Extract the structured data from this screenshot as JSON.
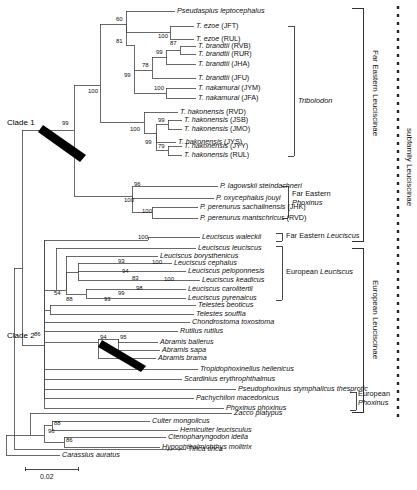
{
  "figure": {
    "type": "phylogenetic-tree",
    "scale_bar": {
      "label": "0.02",
      "value": 0.02
    },
    "clade_annotations": [
      {
        "label": "Clade 1",
        "support": "99"
      },
      {
        "label": "Clade 2",
        "support": "86"
      }
    ],
    "right_vertical_labels": [
      {
        "text": "Far Eastern Leuciscinae"
      },
      {
        "text": "subfamily Leuciscinae"
      },
      {
        "text": "European Leuciscinae"
      }
    ],
    "group_labels": [
      {
        "text": "Tribolodon",
        "italic": true
      },
      {
        "text": "Far Eastern",
        "italic": false
      },
      {
        "text": "Phoxinus",
        "italic": true
      },
      {
        "text": "Far Eastern ",
        "italic": false
      },
      {
        "text": "Leuciscus",
        "italic": true
      },
      {
        "text": "European Leuciscus",
        "italic": false
      },
      {
        "text": "European",
        "italic": false
      },
      {
        "text": "Phoxinus",
        "italic": true
      }
    ],
    "taxa": [
      {
        "id": "t1",
        "name": "Pseudaspius leptocephalus",
        "pop": ""
      },
      {
        "id": "t2",
        "name": "T. ezoe",
        "pop": "(JFT)"
      },
      {
        "id": "t3",
        "name": "T. ezoe",
        "pop": "(RUL)"
      },
      {
        "id": "t4",
        "name": "T. brandtii",
        "pop": "(RVB)"
      },
      {
        "id": "t5",
        "name": "T. brandtii",
        "pop": "(RUR)"
      },
      {
        "id": "t6",
        "name": "T. brandtii",
        "pop": "(JHA)"
      },
      {
        "id": "t7",
        "name": "T. brandtii",
        "pop": "(JFU)"
      },
      {
        "id": "t8",
        "name": "T. nakamurai",
        "pop": "(JYM)"
      },
      {
        "id": "t9",
        "name": "T. nakamurai",
        "pop": "(JFA)"
      },
      {
        "id": "t10",
        "name": "T. hakonensis",
        "pop": "(RVD)"
      },
      {
        "id": "t11",
        "name": "T. hakonensis",
        "pop": "(JSB)"
      },
      {
        "id": "t12",
        "name": "T. hakonensis",
        "pop": "(JMO)"
      },
      {
        "id": "t13",
        "name": "T. hakonensis",
        "pop": "(JYS)"
      },
      {
        "id": "t14",
        "name": "T. hakonensis",
        "pop": "(JYY)"
      },
      {
        "id": "t15",
        "name": "T. hakonensis",
        "pop": "(RUL)"
      },
      {
        "id": "t16",
        "name": "P. lagowskii steindachneri",
        "pop": ""
      },
      {
        "id": "t17",
        "name": "P. oxycephalus jouyi",
        "pop": ""
      },
      {
        "id": "t18",
        "name": "P. perenurus sachalinensis",
        "pop": "(JHK)"
      },
      {
        "id": "t19",
        "name": "P. perenurus mantschricus",
        "pop": "(RVD)"
      },
      {
        "id": "t20",
        "name": "Leuciscus waleckii",
        "pop": ""
      },
      {
        "id": "t21",
        "name": "Leuciscus leuciscus",
        "pop": ""
      },
      {
        "id": "t22",
        "name": "Leuciscus borysthenicus",
        "pop": ""
      },
      {
        "id": "t23",
        "name": "Leuciscus cephalus",
        "pop": ""
      },
      {
        "id": "t24",
        "name": "Leuciscus peloponnesis",
        "pop": ""
      },
      {
        "id": "t25",
        "name": "Leuciscus keadicus",
        "pop": ""
      },
      {
        "id": "t26",
        "name": "Leuciscus carolitertii",
        "pop": ""
      },
      {
        "id": "t27",
        "name": "Leuciscus pyrenaicus",
        "pop": ""
      },
      {
        "id": "t28",
        "name": "Telestes beoticus",
        "pop": ""
      },
      {
        "id": "t29",
        "name": "Telestes souffia",
        "pop": ""
      },
      {
        "id": "t30",
        "name": "Chondrostoma toxostoma",
        "pop": ""
      },
      {
        "id": "t31",
        "name": "Rutilus rutilus",
        "pop": ""
      },
      {
        "id": "t32",
        "name": "Abramis ballerus",
        "pop": ""
      },
      {
        "id": "t33",
        "name": "Abramis sapa",
        "pop": ""
      },
      {
        "id": "t34",
        "name": "Abramis brama",
        "pop": ""
      },
      {
        "id": "t35",
        "name": "Tropidophoxinellus hellenicus",
        "pop": ""
      },
      {
        "id": "t36",
        "name": "Scardinius erythrophthalmus",
        "pop": ""
      },
      {
        "id": "t37",
        "name": "Pseudophoxinus stymphalicus thesprotic",
        "pop": ""
      },
      {
        "id": "t38",
        "name": "Pachychilon macedonicus",
        "pop": ""
      },
      {
        "id": "t39",
        "name": "Phoxinus phoxinus",
        "pop": ""
      },
      {
        "id": "t40",
        "name": "Zacco platypus",
        "pop": ""
      },
      {
        "id": "t41",
        "name": "Culter mongolicus",
        "pop": ""
      },
      {
        "id": "t42",
        "name": "Hemiculter leucisculus",
        "pop": ""
      },
      {
        "id": "t43",
        "name": "Ctenopharyngodon idella",
        "pop": ""
      },
      {
        "id": "t44",
        "name": "Hypophthalmichthys molitrix",
        "pop": ""
      },
      {
        "id": "t45",
        "name": "Tinca tinca",
        "pop": ""
      },
      {
        "id": "t46",
        "name": "Carassius auratus",
        "pop": ""
      }
    ],
    "bootstrap_values": [
      {
        "id": "b1",
        "value": "60"
      },
      {
        "id": "b2",
        "value": "100"
      },
      {
        "id": "b3",
        "value": "81"
      },
      {
        "id": "b4",
        "value": "87"
      },
      {
        "id": "b5",
        "value": "99"
      },
      {
        "id": "b6",
        "value": "78"
      },
      {
        "id": "b7",
        "value": "99"
      },
      {
        "id": "b8",
        "value": "100"
      },
      {
        "id": "b9",
        "value": "100"
      },
      {
        "id": "b10",
        "value": "99"
      },
      {
        "id": "b11",
        "value": "100"
      },
      {
        "id": "b12",
        "value": "99"
      },
      {
        "id": "b13",
        "value": "99"
      },
      {
        "id": "b14",
        "value": "79"
      },
      {
        "id": "b15",
        "value": "96"
      },
      {
        "id": "b16",
        "value": "100"
      },
      {
        "id": "b17",
        "value": "100"
      },
      {
        "id": "b18",
        "value": "100"
      },
      {
        "id": "b19",
        "value": "93"
      },
      {
        "id": "b20",
        "value": "100"
      },
      {
        "id": "b21",
        "value": "94"
      },
      {
        "id": "b22",
        "value": "83"
      },
      {
        "id": "b23",
        "value": "100"
      },
      {
        "id": "b24",
        "value": "98"
      },
      {
        "id": "b25",
        "value": "99"
      },
      {
        "id": "b26",
        "value": "93"
      },
      {
        "id": "b27",
        "value": "54"
      },
      {
        "id": "b28",
        "value": "88"
      },
      {
        "id": "b29",
        "value": "94"
      },
      {
        "id": "b30",
        "value": "95"
      },
      {
        "id": "b31",
        "value": "86"
      },
      {
        "id": "b32",
        "value": "88"
      },
      {
        "id": "b33",
        "value": "96"
      },
      {
        "id": "b34",
        "value": "86"
      }
    ]
  }
}
